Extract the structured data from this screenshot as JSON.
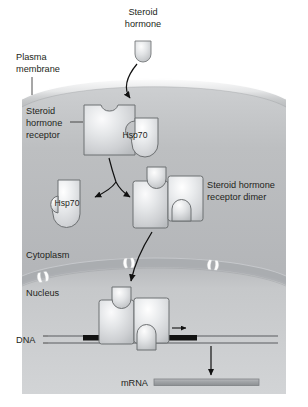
{
  "figure": {
    "background_color": "#ffffff",
    "cell_fill": "#b9bbbd",
    "nucleus_fill": "#c9cbcd",
    "protein_fill": "#d6d8da",
    "protein_stroke": "#6d7072",
    "dna_color": "#5a5d60",
    "response_element_color": "#1a1a1a",
    "mrna_fill": "#9ea1a4",
    "arrow_color": "#1a1a1a",
    "text_color": "#231f20"
  },
  "labels": {
    "steroid_hormone": {
      "line1": "Steroid",
      "line2": "hormone"
    },
    "plasma_membrane": {
      "line1": "Plasma",
      "line2": "membrane"
    },
    "steroid_hormone_receptor": {
      "line1": "Steroid",
      "line2": "hormone",
      "line3": "receptor"
    },
    "hsp70_bound": "Hsp70",
    "hsp70_released": "Hsp70",
    "receptor_dimer": {
      "line1": "Steroid hormone",
      "line2": "receptor dimer"
    },
    "cytoplasm": "Cytoplasm",
    "nucleus": "Nucleus",
    "dna": "DNA",
    "mrna": "mRNA"
  },
  "pathway_steps": [
    "Steroid hormone crosses the plasma membrane",
    "Hormone binds the steroid hormone receptor complexed with Hsp70",
    "Hsp70 is released and receptors dimerize",
    "Steroid hormone receptor dimer enters the nucleus through a nuclear pore",
    "Dimer binds the DNA response element",
    "mRNA is transcribed"
  ],
  "structures": {
    "nuclear_pore_count": 3,
    "hormone_shape": "dome",
    "receptor_shape": "notched-rectangle"
  }
}
